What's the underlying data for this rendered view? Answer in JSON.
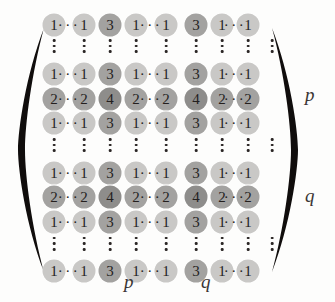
{
  "figure": {
    "type": "matrix",
    "rows": 9,
    "cols": 9,
    "colors": {
      "value_1": "#c9c8c6",
      "value_2": "#a3a2a0",
      "value_3": "#a3a2a0",
      "value_4": "#8e8d8b",
      "text": "#241f1e",
      "background": "#fdfdfc"
    }
  },
  "ellipsis": {
    "horizontal": "···",
    "vertical_dots": 3
  },
  "matrix": {
    "column_positions": [
      10,
      40,
      66,
      92,
      122,
      152,
      178,
      204,
      228
    ],
    "hdots_positions": [
      25,
      107,
      191
    ],
    "rows": [
      {
        "kind": "values",
        "y": 12,
        "cells": [
          "1",
          "1",
          "3",
          "1",
          "1",
          "3",
          "1",
          "1"
        ]
      },
      {
        "kind": "vdots",
        "y": 40
      },
      {
        "kind": "values",
        "y": 68,
        "cells": [
          "1",
          "1",
          "3",
          "1",
          "1",
          "3",
          "1",
          "1"
        ]
      },
      {
        "kind": "values",
        "y": 96,
        "cells": [
          "2",
          "2",
          "4",
          "2",
          "2",
          "4",
          "2",
          "2"
        ]
      },
      {
        "kind": "values",
        "y": 124,
        "cells": [
          "1",
          "1",
          "3",
          "1",
          "1",
          "3",
          "1",
          "1"
        ]
      },
      {
        "kind": "vdots",
        "y": 152
      },
      {
        "kind": "values",
        "y": 180,
        "cells": [
          "1",
          "1",
          "3",
          "1",
          "1",
          "3",
          "1",
          "1"
        ]
      },
      {
        "kind": "values",
        "y": 208,
        "cells": [
          "2",
          "2",
          "4",
          "2",
          "2",
          "4",
          "2",
          "2"
        ]
      },
      {
        "kind": "values",
        "y": 236,
        "cells": [
          "1",
          "1",
          "3",
          "1",
          "1",
          "3",
          "1",
          "1"
        ]
      },
      {
        "kind": "vdots",
        "y": 264
      },
      {
        "kind": "values",
        "y": 292,
        "cells": [
          "1",
          "1",
          "3",
          "1",
          "1",
          "3",
          "1",
          "1"
        ]
      }
    ],
    "row_values_full": [
      [
        "1",
        "···",
        "1",
        "3",
        "1",
        "···",
        "1",
        "3",
        "1",
        "···",
        "1"
      ],
      [
        "1",
        "···",
        "1",
        "3",
        "1",
        "···",
        "1",
        "3",
        "1",
        "···",
        "1"
      ],
      [
        "2",
        "···",
        "2",
        "4",
        "2",
        "···",
        "2",
        "4",
        "2",
        "···",
        "2"
      ],
      [
        "1",
        "···",
        "1",
        "3",
        "1",
        "···",
        "1",
        "3",
        "1",
        "···",
        "1"
      ],
      [
        "1",
        "···",
        "1",
        "3",
        "1",
        "···",
        "1",
        "3",
        "1",
        "···",
        "1"
      ],
      [
        "2",
        "···",
        "2",
        "4",
        "2",
        "···",
        "2",
        "4",
        "2",
        "···",
        "2"
      ],
      [
        "1",
        "···",
        "1",
        "3",
        "1",
        "···",
        "1",
        "3",
        "1",
        "···",
        "1"
      ],
      [
        "1",
        "···",
        "1",
        "3",
        "1",
        "···",
        "1",
        "3",
        "1",
        "···",
        "1"
      ]
    ]
  },
  "labels": {
    "right_upper": "p",
    "right_lower": "q",
    "bottom_left": "p",
    "bottom_right": "q"
  }
}
